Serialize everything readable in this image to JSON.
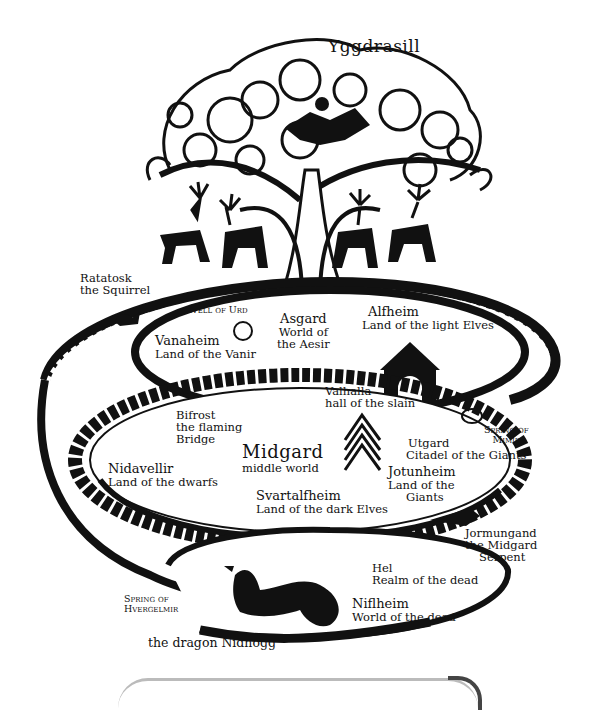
{
  "title": "Yggdrasill",
  "labels": {
    "ratatosk": {
      "name": "Ratatosk",
      "desc": "the Squirrel"
    },
    "well_of_urd": {
      "name": "Well of Urd"
    },
    "vanaheim": {
      "name": "Vanaheim",
      "desc": "Land of the Vanir"
    },
    "asgard": {
      "name": "Asgard",
      "desc1": "World of",
      "desc2": "the Aesir"
    },
    "alfheim": {
      "name": "Alfheim",
      "desc": "Land of the light Elves"
    },
    "valhalla": {
      "name": "Valhalla",
      "desc": "hall of the slain"
    },
    "bifrost": {
      "name": "Bifrost",
      "desc1": "the flaming",
      "desc2": "Bridge"
    },
    "midgard": {
      "name": "Midgard",
      "desc": "middle world"
    },
    "nidavellir": {
      "name": "Nidavellir",
      "desc": "Land of the dwarfs"
    },
    "svartalfheim": {
      "name": "Svartalfheim",
      "desc": "Land of the dark Elves"
    },
    "utgard": {
      "name": "Utgard",
      "desc": "Citadel of the Giants"
    },
    "jotunheim": {
      "name": "Jotunheim",
      "desc1": "Land of the",
      "desc2": "Giants"
    },
    "spring_of_mimir": {
      "name1": "Spring of",
      "name2": "Mimir"
    },
    "jormungand": {
      "name": "Jormungand",
      "desc1": "the Midgard",
      "desc2": "Serpent"
    },
    "hel": {
      "name": "Hel",
      "desc": "Realm of the dead"
    },
    "niflheim": {
      "name": "Niflheim",
      "desc": "World of the dead"
    },
    "spring_of_hvergelmir": {
      "name1": "Spring of",
      "name2": "Hvergelmir"
    },
    "nidhogg": {
      "name": "the dragon Nidhogg"
    }
  },
  "colors": {
    "ink": "#111111",
    "paper": "#ffffff"
  }
}
